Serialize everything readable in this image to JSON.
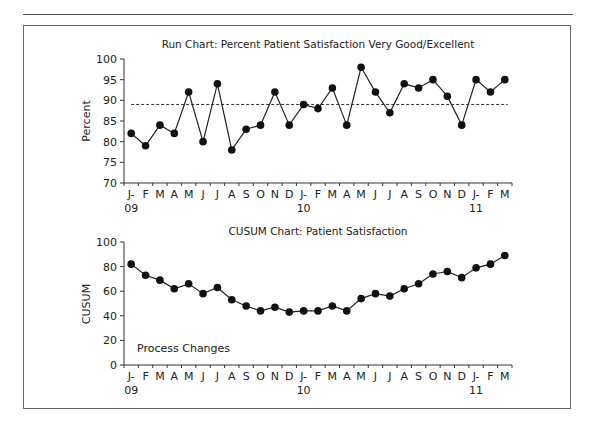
{
  "chart_data": [
    {
      "type": "line",
      "title": "Run Chart: Percent Patient Satisfaction Very Good/Excellent",
      "xlabel": "",
      "ylabel": "Percent",
      "ylim": [
        70,
        100
      ],
      "yticks": [
        70,
        75,
        80,
        85,
        90,
        95,
        100
      ],
      "grid": false,
      "categories": [
        "J-09",
        "F",
        "M",
        "A",
        "M",
        "J",
        "J",
        "A",
        "S",
        "O",
        "N",
        "D",
        "J-10",
        "F",
        "M",
        "A",
        "M",
        "J",
        "J",
        "A",
        "S",
        "O",
        "N",
        "D",
        "J-11",
        "F",
        "M"
      ],
      "tick_labels_line1": [
        "J-",
        "F",
        "M",
        "A",
        "M",
        "J",
        "J",
        "A",
        "S",
        "O",
        "N",
        "D",
        "J-",
        "F",
        "M",
        "A",
        "M",
        "J",
        "J",
        "A",
        "S",
        "O",
        "N",
        "D",
        "J-",
        "F",
        "M"
      ],
      "tick_labels_line2": [
        "09",
        "",
        "",
        "",
        "",
        "",
        "",
        "",
        "",
        "",
        "",
        "",
        "10",
        "",
        "",
        "",
        "",
        "",
        "",
        "",
        "",
        "",
        "",
        "",
        "11",
        "",
        ""
      ],
      "series": [
        {
          "name": "Percent Very Good/Excellent",
          "values": [
            82,
            79,
            84,
            82,
            92,
            80,
            94,
            78,
            83,
            84,
            92,
            84,
            89,
            88,
            93,
            84,
            98,
            92,
            87,
            94,
            93,
            95,
            91,
            84,
            95,
            92,
            95
          ]
        }
      ],
      "reference_line": {
        "label": "median",
        "value": 89,
        "style": "dashed"
      }
    },
    {
      "type": "line",
      "title": "CUSUM Chart: Patient Satisfaction",
      "xlabel": "",
      "ylabel": "CUSUM",
      "ylim": [
        0,
        100
      ],
      "yticks": [
        0,
        20,
        40,
        60,
        80,
        100
      ],
      "grid": false,
      "categories": [
        "J-09",
        "F",
        "M",
        "A",
        "M",
        "J",
        "J",
        "A",
        "S",
        "O",
        "N",
        "D",
        "J-10",
        "F",
        "M",
        "A",
        "M",
        "J",
        "J",
        "A",
        "S",
        "O",
        "N",
        "D",
        "J-11",
        "F",
        "M"
      ],
      "tick_labels_line1": [
        "J-",
        "F",
        "M",
        "A",
        "M",
        "J",
        "J",
        "A",
        "S",
        "O",
        "N",
        "D",
        "J-",
        "F",
        "M",
        "A",
        "M",
        "J",
        "J",
        "A",
        "S",
        "O",
        "N",
        "D",
        "J-",
        "F",
        "M"
      ],
      "tick_labels_line2": [
        "09",
        "",
        "",
        "",
        "",
        "",
        "",
        "",
        "",
        "",
        "",
        "",
        "10",
        "",
        "",
        "",
        "",
        "",
        "",
        "",
        "",
        "",
        "",
        "",
        "11",
        "",
        ""
      ],
      "series": [
        {
          "name": "CUSUM",
          "values": [
            82,
            73,
            69,
            62,
            66,
            58,
            63,
            53,
            48,
            44,
            47,
            43,
            44,
            44,
            48,
            44,
            54,
            58,
            56,
            62,
            66,
            74,
            76,
            71,
            79,
            82,
            89
          ]
        }
      ],
      "annotation": "Process Changes"
    }
  ]
}
